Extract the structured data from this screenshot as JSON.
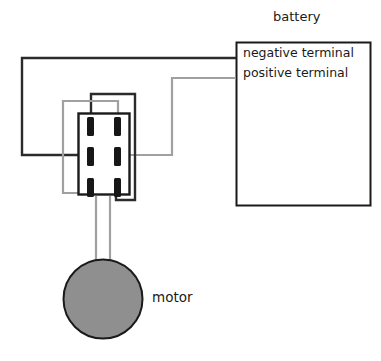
{
  "diagram": {
    "title_text": "battery",
    "labels": {
      "battery": "battery",
      "negative_terminal": "negative terminal",
      "positive_terminal": "positive terminal",
      "motor": "motor"
    },
    "colors": {
      "wire_dark": "#2b2b2b",
      "wire_gray": "#a0a0a0",
      "outline": "#1a1a1a",
      "motor_fill": "#8f8f8f",
      "terminal_fill": "#171717",
      "background": "#ffffff"
    },
    "battery_box": {
      "x": 236,
      "y": 42,
      "width": 135,
      "height": 164
    },
    "switch_box": {
      "x": 78,
      "y": 113,
      "width": 52,
      "height": 82
    },
    "motor_circle": {
      "cx": 103,
      "cy": 299,
      "r": 40
    },
    "switch_terminals": [
      {
        "name": "top-left",
        "x": 91,
        "y": 124
      },
      {
        "name": "top-right",
        "x": 118,
        "y": 124
      },
      {
        "name": "middle-left",
        "x": 91,
        "y": 155
      },
      {
        "name": "middle-right",
        "x": 118,
        "y": 155
      },
      {
        "name": "bottom-left",
        "x": 91,
        "y": 187
      },
      {
        "name": "bottom-right",
        "x": 118,
        "y": 187
      }
    ],
    "wires": [
      {
        "name": "battery-negative-to-switch-middle-left",
        "color": "dark",
        "path": "M 236,58 L 22,58 L 22,155 L 91,155"
      },
      {
        "name": "battery-positive-to-switch-middle-right",
        "color": "gray",
        "path": "M 236,78 L 172,78 L 172,155 L 118,155"
      },
      {
        "name": "switch-top-left-cross-to-bottom-right",
        "color": "dark",
        "path": "M 91,120 L 91,94 L 135,94 L 135,200 L 118,200 L 118,187"
      },
      {
        "name": "switch-top-right-cross-to-bottom-left",
        "color": "gray",
        "path": "M 118,120 L 118,101 L 63,101 L 63,193 L 91,193 L 91,187"
      },
      {
        "name": "switch-bottom-left-to-motor",
        "color": "gray",
        "path": "M 96,195 L 96,262"
      },
      {
        "name": "switch-bottom-right-to-motor",
        "color": "gray",
        "path": "M 110,195 L 110,262"
      }
    ]
  }
}
